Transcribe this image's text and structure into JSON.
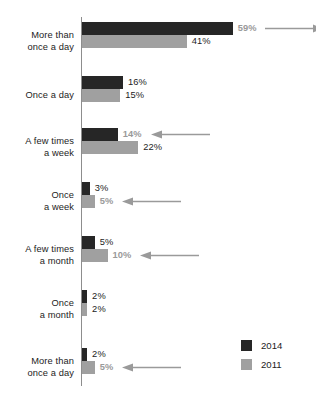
{
  "chart_data": {
    "type": "bar",
    "orientation": "horizontal",
    "title": "",
    "subtitle": "",
    "xlabel": "",
    "ylabel": "",
    "grid": false,
    "xlim": [
      0,
      59
    ],
    "legend_position": "bottom-right",
    "categories": [
      "More than once a day",
      "Once a day",
      "A few times a week",
      "Once a week",
      "A few times a month",
      "Once a month",
      "More than once a day"
    ],
    "series": [
      {
        "name": "2014",
        "color": "#262626",
        "values": [
          59,
          16,
          14,
          3,
          5,
          2,
          2
        ]
      },
      {
        "name": "2011",
        "color": "#a0a0a0",
        "values": [
          41,
          15,
          22,
          5,
          10,
          2,
          5
        ]
      }
    ]
  },
  "axis": {
    "categories": [
      {
        "line1": "More than",
        "line2": "once a day"
      },
      {
        "line1": "Once a day",
        "line2": ""
      },
      {
        "line1": "A few times",
        "line2": "a week"
      },
      {
        "line1": "Once",
        "line2": "a week"
      },
      {
        "line1": "A few times",
        "line2": "a month"
      },
      {
        "line1": "Once",
        "line2": "a month"
      },
      {
        "line1": "More than",
        "line2": "once a day"
      }
    ]
  },
  "groups": [
    {
      "bars": [
        {
          "series": "2014",
          "value": 59,
          "label": "59%",
          "highlight": true,
          "arrow": "right"
        },
        {
          "series": "2011",
          "value": 41,
          "label": "41%",
          "highlight": false,
          "arrow": "none"
        }
      ]
    },
    {
      "bars": [
        {
          "series": "2014",
          "value": 16,
          "label": "16%",
          "highlight": false,
          "arrow": "none"
        },
        {
          "series": "2011",
          "value": 15,
          "label": "15%",
          "highlight": false,
          "arrow": "none"
        }
      ]
    },
    {
      "bars": [
        {
          "series": "2014",
          "value": 14,
          "label": "14%",
          "highlight": true,
          "arrow": "left"
        },
        {
          "series": "2011",
          "value": 22,
          "label": "22%",
          "highlight": false,
          "arrow": "none"
        }
      ]
    },
    {
      "bars": [
        {
          "series": "2014",
          "value": 3,
          "label": "3%",
          "highlight": false,
          "arrow": "none"
        },
        {
          "series": "2011",
          "value": 5,
          "label": "5%",
          "highlight": true,
          "arrow": "left"
        }
      ]
    },
    {
      "bars": [
        {
          "series": "2014",
          "value": 5,
          "label": "5%",
          "highlight": false,
          "arrow": "none"
        },
        {
          "series": "2011",
          "value": 10,
          "label": "10%",
          "highlight": true,
          "arrow": "left"
        }
      ]
    },
    {
      "bars": [
        {
          "series": "2014",
          "value": 2,
          "label": "2%",
          "highlight": false,
          "arrow": "none"
        },
        {
          "series": "2011",
          "value": 2,
          "label": "2%",
          "highlight": false,
          "arrow": "none"
        }
      ]
    },
    {
      "bars": [
        {
          "series": "2014",
          "value": 2,
          "label": "2%",
          "highlight": false,
          "arrow": "none"
        },
        {
          "series": "2011",
          "value": 5,
          "label": "5%",
          "highlight": true,
          "arrow": "left"
        }
      ]
    }
  ],
  "legend": {
    "items": [
      {
        "label": "2014",
        "color": "#262626"
      },
      {
        "label": "2011",
        "color": "#a0a0a0"
      }
    ]
  },
  "colors": {
    "series_2014": "#262626",
    "series_2011": "#a0a0a0",
    "axis_line": "#8d8d8d",
    "label_normal": "#1c1c1c",
    "label_highlight": "#9a9a9a",
    "arrow": "#9a9a9a",
    "background": "#ffffff"
  }
}
